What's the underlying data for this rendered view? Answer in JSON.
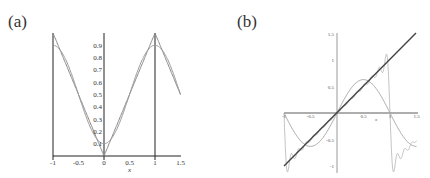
{
  "chart_data": [
    {
      "panel": "(a)",
      "type": "line",
      "title": "",
      "xlabel": "x",
      "ylabel": "",
      "xlim": [
        -1,
        1.5
      ],
      "ylim": [
        0,
        1
      ],
      "x_ticks": [
        "-1",
        "-0.5",
        "0",
        "0.5",
        "1",
        "1.5"
      ],
      "y_ticks": [
        "0.1",
        "0.2",
        "0.3",
        "0.4",
        "0.5",
        "0.6",
        "0.7",
        "0.8",
        "0.9"
      ],
      "grid": false,
      "series": [
        {
          "name": "triangle wave |x| (periodic)",
          "x": [
            -1,
            -0.5,
            0,
            0.5,
            1,
            1.5
          ],
          "values": [
            1,
            0.5,
            0,
            0.5,
            1,
            0.5
          ]
        },
        {
          "name": "smooth Fourier approximation",
          "x": [
            -1,
            -0.5,
            0,
            0.5,
            1,
            1.5
          ],
          "values": [
            0.9,
            0.5,
            0.1,
            0.5,
            0.9,
            0.5
          ]
        }
      ],
      "annotations": [
        "vertical lines at x = -1 and x = 1"
      ]
    },
    {
      "panel": "(b)",
      "type": "line",
      "title": "",
      "xlabel": "x",
      "ylabel": "",
      "xlim": [
        -1,
        1.5
      ],
      "ylim": [
        -1,
        1.5
      ],
      "x_ticks": [
        "-1",
        "-0.5",
        "0.5",
        "1",
        "1.5"
      ],
      "y_ticks": [
        "1.5",
        "1",
        "0.5",
        "-0.5",
        "-1"
      ],
      "grid": false,
      "series": [
        {
          "name": "y = x",
          "x": [
            -1,
            0,
            1,
            1.5
          ],
          "values": [
            -1,
            0,
            1,
            1.5
          ]
        },
        {
          "name": "sine approximation",
          "x": [
            -1,
            -0.5,
            0,
            0.5,
            1,
            1.5
          ],
          "values": [
            0,
            -0.63,
            0,
            0.63,
            0,
            -0.63
          ]
        },
        {
          "name": "Fourier partial sum (sawtooth, Gibbs)",
          "x": [
            -1,
            -0.5,
            0,
            0.5,
            0.95,
            1,
            1.05,
            1.5
          ],
          "values": [
            0,
            -0.5,
            0,
            0.5,
            1.09,
            0,
            -1.09,
            -0.5
          ]
        }
      ]
    }
  ],
  "labels": {
    "a": "(a)",
    "b": "(b)",
    "xa": "x",
    "xb": "x"
  },
  "ticks_a_x": [
    "-1",
    "-0.5",
    "0",
    "0.5",
    "1",
    "1.5"
  ],
  "ticks_a_y": [
    "0.1",
    "0.2",
    "0.3",
    "0.4",
    "0.5",
    "0.6",
    "0.7",
    "0.8",
    "0.9"
  ],
  "ticks_b_x": [
    "-1",
    "-0.5",
    "0.5",
    "1",
    "1.5"
  ],
  "ticks_b_y": [
    "1.5",
    "1",
    "0.5",
    "-0.5",
    "-1"
  ]
}
